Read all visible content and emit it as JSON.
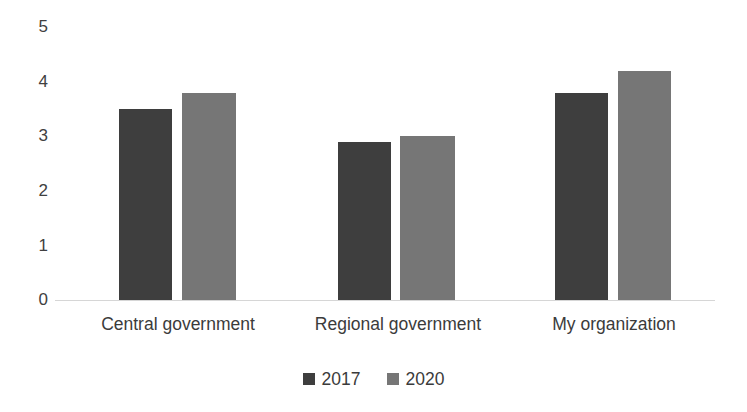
{
  "chart_data": {
    "type": "bar",
    "title": "",
    "subtitle": "",
    "xlabel": "",
    "ylabel": "",
    "categories": [
      "Central government",
      "Regional government",
      "My organization"
    ],
    "series": [
      {
        "name": "2017",
        "color": "#3e3e3e",
        "values": [
          3.5,
          2.9,
          3.8
        ]
      },
      {
        "name": "2020",
        "color": "#767676",
        "values": [
          3.8,
          3.0,
          4.2
        ]
      }
    ],
    "ylim": [
      0,
      5
    ],
    "ytick_labels": [
      "5",
      "4",
      "3",
      "2",
      "1",
      "0"
    ],
    "ytick_values": [
      5,
      4,
      3,
      2,
      1,
      0
    ],
    "grid": false,
    "legend_position": "bottom",
    "axis_color": "#d6d6d6",
    "background": "#ffffff"
  }
}
